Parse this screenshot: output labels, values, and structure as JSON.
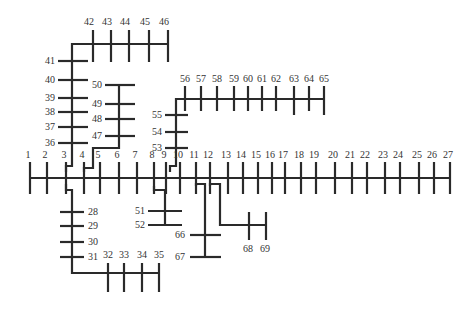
{
  "diagram": {
    "type": "radial-distribution-feeder-single-line",
    "colors": {
      "line": "#2a2a2a",
      "label": "#333333",
      "background": "#ffffff"
    },
    "main_feeder": {
      "y": 178,
      "tick_top": 162,
      "tick_bottom": 194,
      "buses": [
        {
          "id": "1",
          "x": 30
        },
        {
          "id": "2",
          "x": 47
        },
        {
          "id": "3",
          "x": 66
        },
        {
          "id": "4",
          "x": 84
        },
        {
          "id": "5",
          "x": 100
        },
        {
          "id": "6",
          "x": 119
        },
        {
          "id": "7",
          "x": 137
        },
        {
          "id": "8",
          "x": 154
        },
        {
          "id": "9",
          "x": 166
        },
        {
          "id": "10",
          "x": 180
        },
        {
          "id": "11",
          "x": 196
        },
        {
          "id": "12",
          "x": 210
        },
        {
          "id": "13",
          "x": 228
        },
        {
          "id": "14",
          "x": 243
        },
        {
          "id": "15",
          "x": 258
        },
        {
          "id": "16",
          "x": 272
        },
        {
          "id": "17",
          "x": 285
        },
        {
          "id": "18",
          "x": 301
        },
        {
          "id": "19",
          "x": 316
        },
        {
          "id": "20",
          "x": 335
        },
        {
          "id": "21",
          "x": 352
        },
        {
          "id": "22",
          "x": 367
        },
        {
          "id": "23",
          "x": 385
        },
        {
          "id": "24",
          "x": 400
        },
        {
          "id": "25",
          "x": 419
        },
        {
          "id": "26",
          "x": 434
        },
        {
          "id": "27",
          "x": 450
        }
      ]
    },
    "branch_36_46": {
      "vertical_x": 72,
      "buses_vertical": [
        {
          "id": "36",
          "y": 143
        },
        {
          "id": "37",
          "y": 127
        },
        {
          "id": "38",
          "y": 112
        },
        {
          "id": "39",
          "y": 98
        },
        {
          "id": "40",
          "y": 80
        },
        {
          "id": "41",
          "y": 61
        }
      ],
      "top_y": 44,
      "buses_horizontal": [
        {
          "id": "42",
          "x": 93
        },
        {
          "id": "43",
          "x": 111
        },
        {
          "id": "44",
          "x": 129
        },
        {
          "id": "45",
          "x": 149
        },
        {
          "id": "46",
          "x": 168
        }
      ]
    },
    "branch_47_50": {
      "vertical_x": 119,
      "buses": [
        {
          "id": "47",
          "y": 136
        },
        {
          "id": "48",
          "y": 119
        },
        {
          "id": "49",
          "y": 104
        },
        {
          "id": "50",
          "y": 85
        }
      ]
    },
    "branch_53_65": {
      "vertical_x": 176,
      "buses_vertical": [
        {
          "id": "53",
          "y": 148
        },
        {
          "id": "54",
          "y": 132
        },
        {
          "id": "55",
          "y": 115
        }
      ],
      "top_y": 99,
      "buses_horizontal": [
        {
          "id": "56",
          "x": 185
        },
        {
          "id": "57",
          "x": 201
        },
        {
          "id": "58",
          "x": 217
        },
        {
          "id": "59",
          "x": 234
        },
        {
          "id": "60",
          "x": 248
        },
        {
          "id": "61",
          "x": 262
        },
        {
          "id": "62",
          "x": 276
        },
        {
          "id": "63",
          "x": 294
        },
        {
          "id": "64",
          "x": 309
        },
        {
          "id": "65",
          "x": 324
        }
      ]
    },
    "branch_28_35": {
      "vertical_x": 72,
      "buses_vertical": [
        {
          "id": "28",
          "y": 212
        },
        {
          "id": "29",
          "y": 226
        },
        {
          "id": "30",
          "y": 242
        },
        {
          "id": "31",
          "y": 257
        }
      ],
      "bottom_y": 273,
      "buses_horizontal": [
        {
          "id": "32",
          "x": 108
        },
        {
          "id": "33",
          "x": 124
        },
        {
          "id": "34",
          "x": 142
        },
        {
          "id": "35",
          "x": 159
        }
      ]
    },
    "branch_51_52": {
      "vertical_x": 165,
      "buses": [
        {
          "id": "51",
          "y": 211
        },
        {
          "id": "52",
          "y": 225
        }
      ]
    },
    "branch_66_67": {
      "vertical_x": 205,
      "buses": [
        {
          "id": "66",
          "y": 235
        },
        {
          "id": "67",
          "y": 257
        }
      ]
    },
    "branch_68_69": {
      "horizontal_y": 225,
      "buses": [
        {
          "id": "68",
          "x": 249
        },
        {
          "id": "69",
          "x": 266
        }
      ]
    }
  }
}
